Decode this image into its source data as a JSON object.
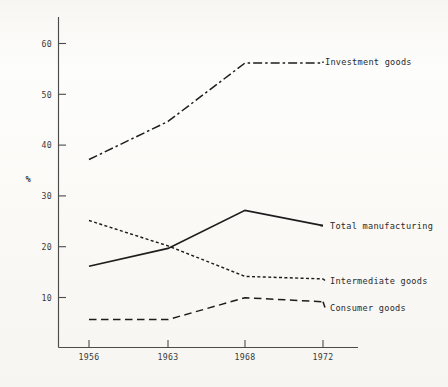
{
  "chart_data": {
    "type": "line",
    "title": "",
    "xlabel": "",
    "ylabel": "%",
    "x": [
      "1956",
      "1963",
      "1968",
      "1972"
    ],
    "categories": [
      "1956",
      "1963",
      "1968",
      "1972"
    ],
    "xlim": [
      1954,
      1974
    ],
    "ylim": [
      0,
      64
    ],
    "yticks": [
      10,
      20,
      30,
      40,
      50,
      60
    ],
    "ytick_labels": [
      "10",
      "20",
      "30",
      "40",
      "50",
      "60"
    ],
    "xtick_labels": [
      "1956",
      "1963",
      "1968",
      "1972"
    ],
    "grid": false,
    "legend_position": "right-inline-labels",
    "series": [
      {
        "name": "Investment goods",
        "values": [
          37,
          44.5,
          56,
          56
        ],
        "style": "dash-dot",
        "color": "#1d1d1d"
      },
      {
        "name": "Total manufacturing",
        "values": [
          16,
          19.5,
          27,
          24
        ],
        "style": "solid",
        "color": "#1d1d1d"
      },
      {
        "name": "Intermediate goods",
        "values": [
          25,
          20,
          14,
          13.5
        ],
        "style": "dotted",
        "color": "#1d1d1d"
      },
      {
        "name": "Consumer goods",
        "values": [
          5.5,
          5.5,
          9.8,
          9
        ],
        "style": "dashed",
        "color": "#1d1d1d"
      }
    ]
  },
  "axis": {
    "y_label": "%",
    "y_ticks": [
      "60",
      "50",
      "40",
      "30",
      "20",
      "10"
    ],
    "x_ticks": [
      "1956",
      "1963",
      "1968",
      "1972"
    ]
  },
  "series_labels": {
    "investment_goods": "Investment goods",
    "total_manufacturing": "Total manufacturing",
    "intermediate_goods": "Intermediate goods",
    "consumer_goods": "Consumer goods"
  },
  "colors": {
    "ink": "#1d1d1d",
    "axis": "#4b4b4b",
    "paper": "#fcfbf9"
  }
}
